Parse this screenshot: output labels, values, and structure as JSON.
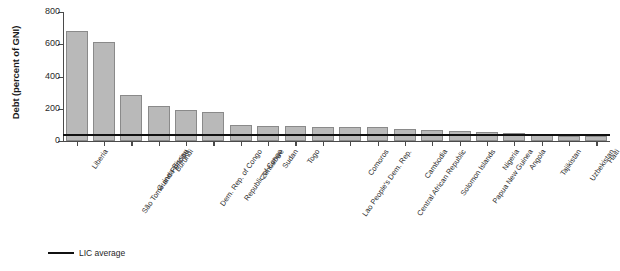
{
  "chart_data": {
    "type": "bar",
    "title": "",
    "xlabel": "",
    "ylabel": "Debt (percent of GNI)",
    "ylim": [
      0,
      800
    ],
    "yticks": [
      0,
      200,
      400,
      600,
      800
    ],
    "grid": false,
    "legend_position": "bottom-left",
    "categories": [
      "Liberia",
      "São Tomé and Principe",
      "Guinea-Bissau",
      "Burundi",
      "Dem. Rep. of Congo",
      "Republic of Congo",
      "Zimbabwe",
      "Sudan",
      "Togo",
      "Lao People's Dem. Rep.",
      "Comoros",
      "Central African Republic",
      "Cambodia",
      "Solomon Islands",
      "Papua New Guinea",
      "Nigeria",
      "Angola",
      "Tajikistan",
      "Uzbekistan",
      "Haiti"
    ],
    "values": [
      682,
      614,
      287,
      219,
      191,
      180,
      97,
      94,
      92,
      90,
      88,
      85,
      72,
      66,
      62,
      54,
      52,
      38,
      33,
      30
    ],
    "series": [
      {
        "name": "Debt (percent of GNI)",
        "values": [
          682,
          614,
          287,
          219,
          191,
          180,
          97,
          94,
          92,
          90,
          88,
          85,
          72,
          66,
          62,
          54,
          52,
          38,
          33,
          30
        ]
      }
    ],
    "reference_line": {
      "label": "LIC average",
      "value": 37,
      "color": "#111111"
    },
    "bar_color": "#b9b9b9",
    "bar_edge_color": "#8a8a8a"
  },
  "legend": {
    "items": [
      {
        "label": "LIC average",
        "color": "#111111",
        "style": "line"
      }
    ]
  },
  "axis": {
    "y_title": "Debt (percent of GNI)",
    "y_tick_labels": [
      "800",
      "600",
      "400",
      "200",
      "0"
    ]
  }
}
